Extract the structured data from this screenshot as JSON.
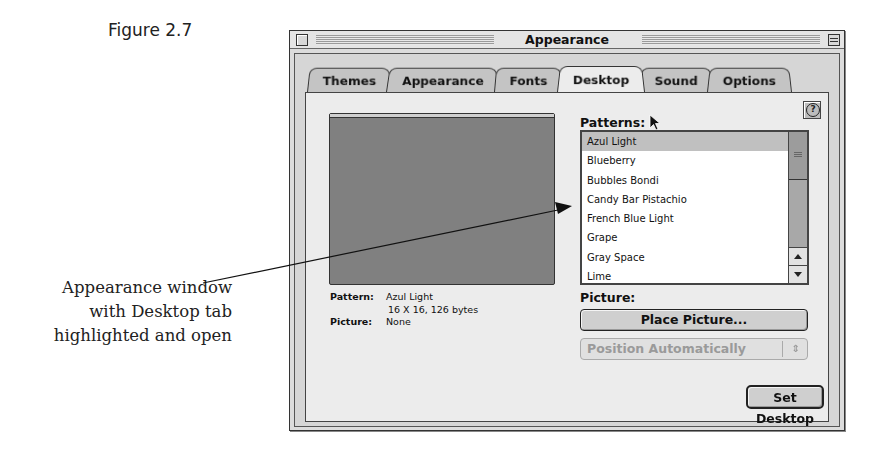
{
  "figure": {
    "label": "Figure 2.7",
    "caption_lines": [
      "Appearance window",
      "with Desktop tab",
      "highlighted and open"
    ]
  },
  "window": {
    "title": "Appearance",
    "tabs": [
      {
        "label": "Themes",
        "active": false
      },
      {
        "label": "Appearance",
        "active": false
      },
      {
        "label": "Fonts",
        "active": false
      },
      {
        "label": "Desktop",
        "active": true
      },
      {
        "label": "Sound",
        "active": false
      },
      {
        "label": "Options",
        "active": false
      }
    ]
  },
  "desktop": {
    "preview_color": "#808080",
    "info": {
      "pattern_key": "Pattern:",
      "pattern_value": "Azul Light",
      "pattern_detail": "16 X 16, 126 bytes",
      "picture_key": "Picture:",
      "picture_value": "None"
    },
    "patterns_label": "Patterns:",
    "patterns": [
      {
        "label": "Azul Light",
        "selected": true
      },
      {
        "label": "Blueberry",
        "selected": false
      },
      {
        "label": "Bubbles Bondi",
        "selected": false
      },
      {
        "label": "Candy Bar Pistachio",
        "selected": false
      },
      {
        "label": "French Blue Light",
        "selected": false
      },
      {
        "label": "Grape",
        "selected": false
      },
      {
        "label": "Gray Space",
        "selected": false
      },
      {
        "label": "Lime",
        "selected": false
      }
    ],
    "picture_label": "Picture:",
    "place_picture_label": "Place Picture...",
    "position_select_value": "Position Automatically",
    "set_desktop_label": "Set Desktop"
  }
}
